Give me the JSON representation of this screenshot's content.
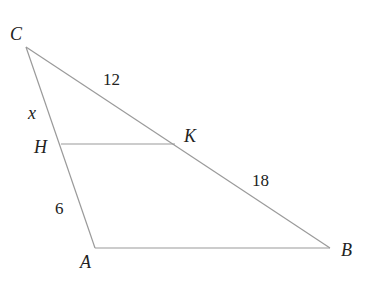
{
  "diagram": {
    "type": "triangle",
    "points": {
      "C": {
        "label": "C",
        "x": 26,
        "y": 47
      },
      "H": {
        "label": "H",
        "x": 61,
        "y": 144
      },
      "K": {
        "label": "K",
        "x": 175,
        "y": 144
      },
      "A": {
        "label": "A",
        "x": 95,
        "y": 248
      },
      "B": {
        "label": "B",
        "x": 330,
        "y": 248
      }
    },
    "segments": [
      {
        "from": "C",
        "to": "A"
      },
      {
        "from": "C",
        "to": "B"
      },
      {
        "from": "A",
        "to": "B"
      },
      {
        "from": "H",
        "to": "K"
      }
    ],
    "measures": {
      "CK": "12",
      "KB": "18",
      "CH": "x",
      "HA": "6"
    }
  }
}
